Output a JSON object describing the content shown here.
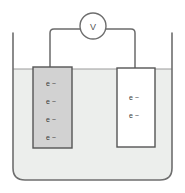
{
  "figure": {
    "background_color": "#ffffff"
  },
  "meter": {
    "name": "voltmeter",
    "label": "V",
    "center_x": 93,
    "center_y": 26,
    "radius": 13,
    "stroke_color": "#6e6e6e",
    "fill_color": "#ffffff"
  },
  "wires": {
    "stroke_color": "#6b6b6b",
    "left": {
      "name": "left-wire",
      "path": "M 50 67 L 50 33 Q 50 29 54 29 L 80 29"
    },
    "right": {
      "name": "right-wire",
      "path": "M 106 29 L 131 29 Q 135 29 135 33 L 135 68"
    }
  },
  "beaker": {
    "name": "beaker",
    "left_x": 13,
    "right_x": 172,
    "top_y": 33,
    "bottom_y": 180,
    "corner_radius": 12,
    "wall_color": "#6e6e6e",
    "liquid": {
      "name": "electrolyte-solution",
      "surface_y": 69,
      "fill_color": "#eceeec",
      "surface_line_color": "#8a8a8a"
    }
  },
  "electrodes": [
    {
      "name": "left-electrode",
      "x": 33,
      "y": 67,
      "width": 39,
      "height": 81,
      "fill_color": "#d2d2d2",
      "stroke_color": "#555555",
      "charge_labels": [
        "e −",
        "e −",
        "e −",
        "e −"
      ],
      "label_positions_y": [
        86,
        104,
        122,
        140
      ],
      "label_x": 46
    },
    {
      "name": "right-electrode",
      "x": 117,
      "y": 68,
      "width": 38,
      "height": 79,
      "fill_color": "#ffffff",
      "stroke_color": "#555555",
      "charge_labels": [
        "e −",
        "e −"
      ],
      "label_positions_y": [
        100,
        118
      ],
      "label_x": 129
    }
  ]
}
